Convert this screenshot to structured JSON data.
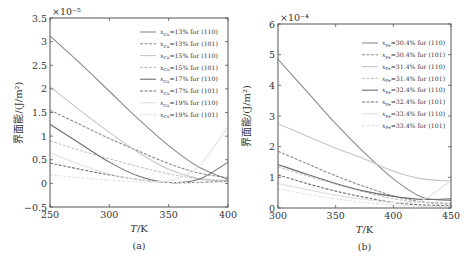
{
  "chart_data": [
    {
      "type": "line",
      "panel": "(a)",
      "title": "",
      "xlabel": "T/K",
      "ylabel": "界面能/(J/m²)",
      "y_multiplier": "×10⁻⁵",
      "xlim": [
        250,
        400
      ],
      "ylim": [
        -0.5,
        3.5
      ],
      "xticks": [
        "250",
        "300",
        "350",
        "400"
      ],
      "yticks": [
        "−0.5",
        "0",
        "0.5",
        "1",
        "1.5",
        "2",
        "2.5",
        "3",
        "3.5"
      ],
      "grid": false,
      "legend_position": "upper right",
      "x": [
        250,
        275,
        300,
        325,
        350,
        375,
        400
      ],
      "series": [
        {
          "name": "xCu=13% for (110)",
          "style": "solid",
          "color": "#8a8a8a",
          "values": [
            3.12,
            2.55,
            1.95,
            1.35,
            0.8,
            0.35,
            0.08
          ]
        },
        {
          "name": "xCu=13% for (101)",
          "style": "dashed",
          "color": "#8a8a8a",
          "values": [
            1.55,
            1.25,
            0.95,
            0.68,
            0.42,
            0.22,
            0.12
          ]
        },
        {
          "name": "xCu=15% for (110)",
          "style": "solid",
          "color": "#c4c4c4",
          "values": [
            2.05,
            1.55,
            1.08,
            0.65,
            0.3,
            0.1,
            0.05
          ]
        },
        {
          "name": "xCu=15% for (101)",
          "style": "dashed",
          "color": "#c4c4c4",
          "values": [
            0.9,
            0.7,
            0.52,
            0.35,
            0.2,
            0.1,
            0.06
          ]
        },
        {
          "name": "xCu=17% for (110)",
          "style": "solid",
          "color": "#6e6e6e",
          "values": [
            1.25,
            0.85,
            0.45,
            0.15,
            0.02,
            0.08,
            0.45
          ]
        },
        {
          "name": "xCu=17% for (101)",
          "style": "dashed",
          "color": "#6e6e6e",
          "values": [
            0.43,
            0.3,
            0.18,
            0.08,
            0.02,
            0.02,
            0.05
          ]
        },
        {
          "name": "xCu=19% for (110)",
          "style": "solid",
          "color": "#e0e0e0",
          "values": [
            0.65,
            0.4,
            0.2,
            0.08,
            0.05,
            0.35,
            1.2
          ]
        },
        {
          "name": "xCu=19% for (101)",
          "style": "dashed",
          "color": "#e0e0e0",
          "values": [
            0.18,
            0.12,
            0.07,
            0.03,
            0.02,
            0.02,
            0.03
          ]
        }
      ]
    },
    {
      "type": "line",
      "panel": "(b)",
      "title": "",
      "xlabel": "T/K",
      "ylabel": "界面能/(J/m²)",
      "y_multiplier": "×10⁻⁴",
      "xlim": [
        300,
        450
      ],
      "ylim": [
        0,
        6
      ],
      "xticks": [
        "300",
        "350",
        "400",
        "450"
      ],
      "yticks": [
        "0",
        "1",
        "2",
        "3",
        "4",
        "5",
        "6"
      ],
      "grid": false,
      "legend_position": "upper right",
      "x": [
        300,
        325,
        350,
        375,
        400,
        425,
        450
      ],
      "series": [
        {
          "name": "xFe=30.4% for (110)",
          "style": "solid",
          "color": "#8a8a8a",
          "values": [
            4.85,
            3.8,
            2.75,
            1.8,
            0.95,
            0.35,
            0.25
          ]
        },
        {
          "name": "xFe=30.4% for (101)",
          "style": "dashed",
          "color": "#8a8a8a",
          "values": [
            1.85,
            1.45,
            1.05,
            0.7,
            0.4,
            0.2,
            0.15
          ]
        },
        {
          "name": "xFe=31.4% for (110)",
          "style": "solid",
          "color": "#c4c4c4",
          "values": [
            2.75,
            2.35,
            1.95,
            1.6,
            1.2,
            0.95,
            0.88
          ]
        },
        {
          "name": "xFe=31.4% for (101)",
          "style": "dashed",
          "color": "#c4c4c4",
          "values": [
            1.35,
            1.05,
            0.78,
            0.52,
            0.3,
            0.18,
            0.12
          ]
        },
        {
          "name": "xFe=32.4% for (110)",
          "style": "solid",
          "color": "#6e6e6e",
          "values": [
            1.42,
            1.1,
            0.8,
            0.55,
            0.38,
            0.28,
            0.3
          ]
        },
        {
          "name": "xFe=32.4% for (101)",
          "style": "dashed",
          "color": "#6e6e6e",
          "values": [
            1.08,
            0.8,
            0.55,
            0.35,
            0.18,
            0.1,
            0.08
          ]
        },
        {
          "name": "xFe=33.4% for (110)",
          "style": "solid",
          "color": "#e0e0e0",
          "values": [
            0.8,
            0.6,
            0.42,
            0.28,
            0.18,
            0.25,
            0.9
          ]
        },
        {
          "name": "xFe=33.4% for (101)",
          "style": "dashed",
          "color": "#e0e0e0",
          "values": [
            0.62,
            0.45,
            0.3,
            0.18,
            0.1,
            0.06,
            0.05
          ]
        }
      ]
    }
  ],
  "panels": {
    "a": {
      "caption": "(a)",
      "xlabel": "T/K",
      "ylabel": "界面能/(J/m²)",
      "multiplier": "×10⁻⁵",
      "legend": [
        "xCu=13% for (110)",
        "xCu=13% for (101)",
        "xCu=15% for (110)",
        "xCu=15% for (101)",
        "xCu=17% for (110)",
        "xCu=17% for (101)",
        "xCu=19% for (110)",
        "xCu=19% for (101)"
      ]
    },
    "b": {
      "caption": "(b)",
      "xlabel": "T/K",
      "ylabel": "界面能/(J/m²)",
      "multiplier": "×10⁻⁴",
      "legend": [
        "xFe=30.4% for (110)",
        "xFe=30.4% for (101)",
        "xFe=31.4% for (110)",
        "xFe=31.4% for (101)",
        "xFe=32.4% for (110)",
        "xFe=32.4% for (101)",
        "xFe=33.4% for (110)",
        "xFe=33.4% for (101)"
      ]
    }
  }
}
